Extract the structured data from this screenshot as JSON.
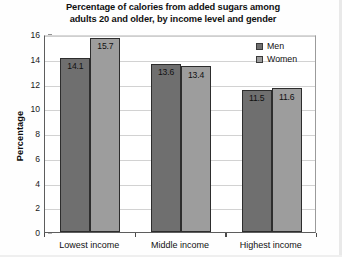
{
  "chart_data": {
    "type": "bar",
    "title": "Percentage of calories from added sugars among adults 20 and older, by income level and gender",
    "title_line1": "Percentage of calories from added sugars among",
    "title_line2": "adults 20 and older, by income level and gender",
    "xlabel": "",
    "ylabel": "Percentage",
    "categories": [
      "Lowest income",
      "Middle income",
      "Highest income"
    ],
    "series": [
      {
        "name": "Men",
        "values": [
          14.1,
          13.6,
          11.5
        ],
        "color": "#6f6f6f"
      },
      {
        "name": "Women",
        "values": [
          15.7,
          13.4,
          11.6
        ],
        "color": "#9d9d9d"
      }
    ],
    "ylim": [
      0,
      16
    ],
    "yticks": [
      0,
      2,
      4,
      6,
      8,
      10,
      12,
      14,
      16
    ],
    "ytick_labels": [
      "0",
      "2",
      "4",
      "6",
      "8",
      "10",
      "12",
      "14",
      "16"
    ],
    "grid": true,
    "grid_axis": "y",
    "legend_position": "top-right",
    "data_labels": true,
    "bar_label_format": "one-decimal"
  }
}
